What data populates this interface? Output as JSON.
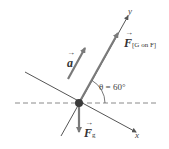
{
  "diagram": {
    "type": "free-body diagram",
    "labels": {
      "force_normal": {
        "symbol": "F",
        "subscript": "[G on F]"
      },
      "force_gravity": {
        "symbol": "F",
        "subscript": "g"
      },
      "acceleration": {
        "symbol": "a"
      },
      "angle": "θ = 60°",
      "x_axis": "x",
      "y_axis": "y"
    },
    "colors": {
      "force_arrow": "#7a7a7a",
      "axis_line": "#555555",
      "dashed_line": "#8a8a8a",
      "object_dot": "#3a3a3a"
    }
  }
}
